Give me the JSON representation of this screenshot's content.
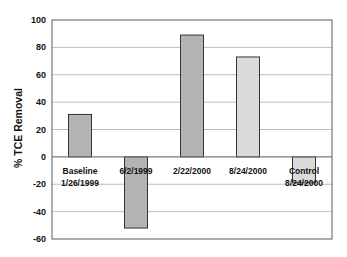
{
  "chart_data": {
    "type": "bar",
    "title": "",
    "xlabel": "",
    "ylabel": "% TCE Removal",
    "ylim": [
      -60,
      100
    ],
    "yticks": [
      100,
      80,
      60,
      40,
      20,
      0,
      -20,
      -40,
      -60
    ],
    "grid": true,
    "legend": null,
    "categories": [
      [
        "Baseline",
        "1/26/1999"
      ],
      [
        "6/2/1999"
      ],
      [
        "2/22/2000"
      ],
      [
        "8/24/2000"
      ],
      [
        "Control",
        "8/24/2000"
      ]
    ],
    "values": [
      31,
      -52,
      89,
      73,
      -19
    ],
    "bar_colors": [
      "#b3b3b3",
      "#b3b3b3",
      "#b3b3b3",
      "#dadada",
      "#dadada"
    ]
  },
  "style": {
    "grid_color": "#bdbdbd",
    "frame_color": "#777777",
    "bar_edge": "#333333"
  }
}
